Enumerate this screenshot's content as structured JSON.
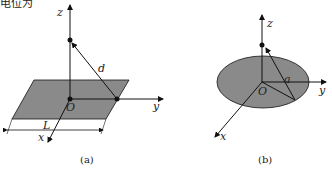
{
  "cut_text": "电位为",
  "figure_a": {
    "axes": {
      "x": "x",
      "y": "y",
      "z": "z"
    },
    "origin": "O",
    "distance_label": "d",
    "length_label": "L",
    "caption": "(a)"
  },
  "figure_b": {
    "axes": {
      "x": "x",
      "y": "y",
      "z": "z"
    },
    "origin": "O",
    "radius_label": "a",
    "caption": "(b)"
  },
  "colors": {
    "fill": "#8a8a8a",
    "line": "#111111"
  }
}
